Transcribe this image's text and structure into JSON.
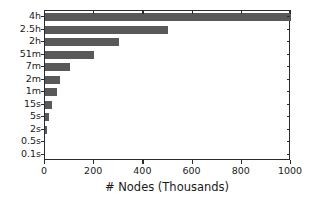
{
  "chart_data": {
    "type": "bar",
    "orientation": "horizontal",
    "title": "",
    "xlabel": "# Nodes (Thousands)",
    "ylabel": "",
    "categories": [
      "4h",
      "2.5h",
      "2h",
      "51m",
      "7m",
      "2m",
      "1m",
      "15s",
      "5s",
      "2s",
      "0.5s",
      "0.1s"
    ],
    "values": [
      1000,
      500,
      300,
      200,
      100,
      60,
      50,
      30,
      18,
      8,
      0,
      0
    ],
    "xlim": [
      0,
      1000
    ],
    "xticks": [
      0,
      200,
      400,
      600,
      800,
      1000
    ],
    "xtick_labels": [
      "0",
      "200",
      "400",
      "600",
      "800",
      "1000"
    ],
    "grid": false,
    "legend": null,
    "bar_color": "#595959",
    "axis_color": "#2b2b2b",
    "background_color": "#ffffff"
  }
}
